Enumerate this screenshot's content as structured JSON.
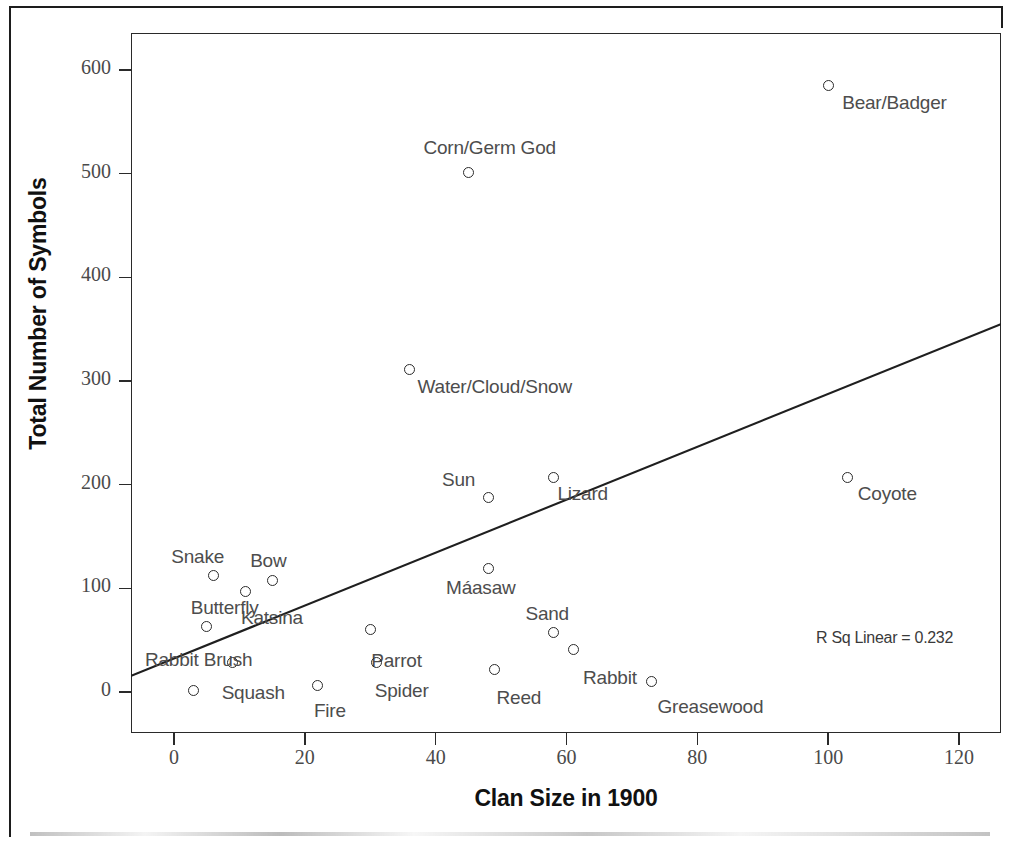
{
  "chart_data": {
    "type": "scatter",
    "title": "",
    "xlabel": "Clan Size in 1900",
    "ylabel": "Total Number of Symbols",
    "xlim": [
      -8,
      128
    ],
    "ylim": [
      -32,
      632
    ],
    "xticks": [
      0,
      20,
      40,
      60,
      80,
      100,
      120
    ],
    "yticks": [
      0,
      100,
      200,
      300,
      400,
      500,
      600
    ],
    "grid": false,
    "legend": null,
    "annotations": [
      "R Sq Linear = 0.232"
    ],
    "fit_line": {
      "type": "linear",
      "r_squared": 0.232,
      "x_start": -8,
      "y_start": 12,
      "x_end": 128,
      "y_end": 359
    },
    "points": [
      {
        "label": "Bear/Badger",
        "x": 100,
        "y": 585,
        "label_dx": 14,
        "label_dy": 16
      },
      {
        "label": "Corn/Germ God",
        "x": 45,
        "y": 501,
        "label_dx": -45,
        "label_dy": -26
      },
      {
        "label": "Water/Cloud/Snow",
        "x": 36,
        "y": 311,
        "label_dx": 8,
        "label_dy": 16
      },
      {
        "label": "Coyote",
        "x": 103,
        "y": 207,
        "label_dx": 10,
        "label_dy": 16
      },
      {
        "label": "Lizard",
        "x": 58,
        "y": 207,
        "label_dx": 4,
        "label_dy": 16
      },
      {
        "label": "Sun",
        "x": 48,
        "y": 188,
        "label_dx": -46,
        "label_dy": -18
      },
      {
        "label": "Máasaw",
        "x": 48,
        "y": 119,
        "label_dx": -42,
        "label_dy": 18
      },
      {
        "label": "Snake",
        "x": 6,
        "y": 112,
        "label_dx": -42,
        "label_dy": -20
      },
      {
        "label": "Bow",
        "x": 15,
        "y": 108,
        "label_dx": -22,
        "label_dy": -20
      },
      {
        "label": "Katsina",
        "x": 11,
        "y": 97,
        "label_dx": -5,
        "label_dy": 26
      },
      {
        "label": "Butterfly",
        "x": 5,
        "y": 63,
        "label_dx": -16,
        "label_dy": -20
      },
      {
        "label": "Sand",
        "x": 58,
        "y": 57,
        "label_dx": -28,
        "label_dy": -20
      },
      {
        "label": "Parrot",
        "x": 30,
        "y": 60,
        "label_dx": 1,
        "label_dy": 30
      },
      {
        "label": "Rabbit Brush",
        "x": 9,
        "y": 28,
        "label_dx": -88,
        "label_dy": -4
      },
      {
        "label": "Spider",
        "x": 31,
        "y": 28,
        "label_dx": -2,
        "label_dy": 27
      },
      {
        "label": "Rabbit",
        "x": 61,
        "y": 41,
        "label_dx": 10,
        "label_dy": 28
      },
      {
        "label": "Reed",
        "x": 49,
        "y": 22,
        "label_dx": 2,
        "label_dy": 28
      },
      {
        "label": "Greasewood",
        "x": 73,
        "y": 10,
        "label_dx": 6,
        "label_dy": 24
      },
      {
        "label": "Squash",
        "x": 3,
        "y": 1,
        "label_dx": 28,
        "label_dy": 1
      },
      {
        "label": "Fire",
        "x": 22,
        "y": 6,
        "label_dx": -4,
        "label_dy": 24
      }
    ]
  },
  "axes": {
    "y_title": "Total Number of Symbols",
    "x_title": "Clan Size in 1900",
    "y_tick_labels": [
      "600",
      "500",
      "400",
      "300",
      "200",
      "100",
      "0"
    ],
    "x_tick_labels": [
      "0",
      "20",
      "40",
      "60",
      "80",
      "100",
      "120"
    ]
  },
  "annotation": {
    "r_squared_text": "R Sq Linear = 0.232"
  },
  "colors": {
    "axis": "#2a2a2a",
    "marker": "#2b2b2b",
    "label_text": "#4d4d4d",
    "tick_text": "#4a4a4a",
    "fit_line": "#1f1f1f"
  }
}
